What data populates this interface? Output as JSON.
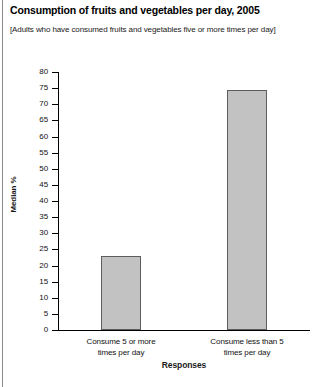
{
  "header": {
    "title": "Consumption of fruits and vegetables per day, 2005",
    "subtitle": "[Adults who have consumed fruits and vegetables five or more times per day]"
  },
  "chart_data": {
    "type": "bar",
    "title": "Consumption of fruits and vegetables per day, 2005",
    "subtitle": "[Adults who have consumed fruits and vegetables five or more times per day]",
    "categories": [
      "Consume 5 or more times per day",
      "Consume less than 5 times per day"
    ],
    "category_lines": [
      [
        "Consume 5 or more",
        "times per day"
      ],
      [
        "Consume less than 5",
        "times per day"
      ]
    ],
    "values": [
      23,
      74.5
    ],
    "xlabel": "Responses",
    "ylabel": "Median %",
    "ylim": [
      0,
      80
    ],
    "ytick_step": 5,
    "yticks": [
      80,
      75,
      70,
      65,
      60,
      55,
      50,
      45,
      40,
      35,
      30,
      25,
      20,
      15,
      10,
      5,
      0
    ],
    "grid": false,
    "legend": false,
    "bar_color": "#c2c2c2",
    "bar_border_color": "#5d5d5d",
    "axis_color": "#000000"
  }
}
